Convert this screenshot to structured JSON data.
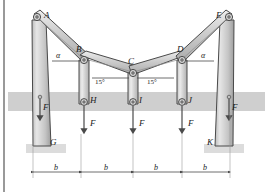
{
  "figure": {
    "colors": {
      "member_fill": "#c9c9c9",
      "member_fill_light": "#e2e2e2",
      "member_stroke": "#4a4a4a",
      "band": "#cfcfcf",
      "footing": "#d8d8d8",
      "line": "#5a5a5a",
      "text": "#1a1a1a",
      "page_border": "#555555"
    }
  },
  "joints": [
    {
      "id": "A",
      "label": "A",
      "x": 36,
      "y": 18
    },
    {
      "id": "B",
      "label": "B",
      "x": 84,
      "y": 60
    },
    {
      "id": "C",
      "label": "C",
      "x": 133,
      "y": 73
    },
    {
      "id": "D",
      "label": "D",
      "x": 182,
      "y": 60
    },
    {
      "id": "E",
      "label": "E",
      "x": 230,
      "y": 18
    },
    {
      "id": "G",
      "label": "G",
      "x": 40,
      "y": 144
    },
    {
      "id": "H",
      "label": "H",
      "x": 84,
      "y": 102
    },
    {
      "id": "I",
      "label": "I",
      "x": 133,
      "y": 102
    },
    {
      "id": "J",
      "label": "J",
      "x": 182,
      "y": 102
    },
    {
      "id": "K",
      "label": "K",
      "x": 226,
      "y": 144
    }
  ],
  "angles": [
    {
      "id": "alpha-left",
      "label": "α",
      "x": 58,
      "y": 55
    },
    {
      "id": "alpha-right",
      "label": "α",
      "x": 203,
      "y": 55
    },
    {
      "id": "fifteen-left",
      "label": "15°",
      "x": 103,
      "y": 76
    },
    {
      "id": "fifteen-right",
      "label": "15°",
      "x": 146,
      "y": 76
    }
  ],
  "forces": [
    {
      "id": "force-left-column",
      "label": "F",
      "x": 43,
      "y": 105
    },
    {
      "id": "force-hanger-h",
      "label": "F",
      "x": 91,
      "y": 119
    },
    {
      "id": "force-hanger-i",
      "label": "F",
      "x": 140,
      "y": 119
    },
    {
      "id": "force-hanger-j",
      "label": "F",
      "x": 189,
      "y": 119
    },
    {
      "id": "force-right-column",
      "label": "F",
      "x": 233,
      "y": 105
    }
  ],
  "dimensions": {
    "line_y": 172,
    "ticks": [
      33,
      81,
      133,
      182,
      230
    ],
    "spans": [
      {
        "id": "span-1",
        "label": "b",
        "x": 57
      },
      {
        "id": "span-2",
        "label": "b",
        "x": 107
      },
      {
        "id": "span-3",
        "label": "b",
        "x": 157
      },
      {
        "id": "span-4",
        "label": "b",
        "x": 206
      }
    ]
  }
}
